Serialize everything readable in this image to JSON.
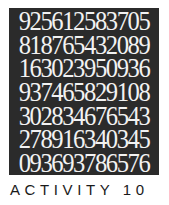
{
  "number_grid": {
    "rows": [
      "925612583705",
      "818765432089",
      "163023950936",
      "937465829108",
      "302834676543",
      "278916340345",
      "093693786576"
    ],
    "background_color": "#2b2b2b",
    "text_color": "#f2f2f2"
  },
  "caption": "ACTIVITY 10"
}
